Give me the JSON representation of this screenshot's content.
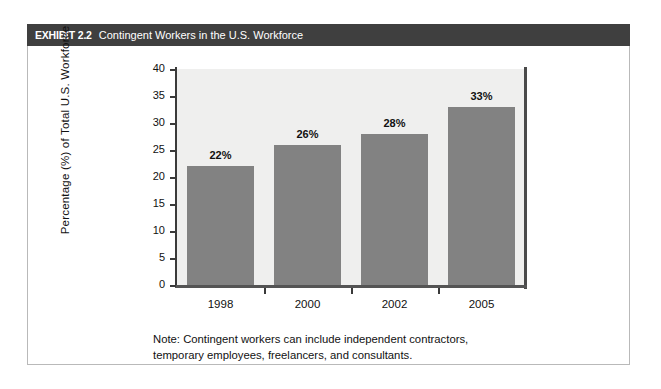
{
  "exhibit": {
    "label": "EXHIBIT 2.2",
    "title": "Contingent Workers in the U.S. Workforce",
    "header_bg": "#3f3f3f",
    "header_text_color": "#ffffff",
    "card_border_color": "#b9b9b9",
    "page_bg": "#ffffff"
  },
  "chart_data": {
    "type": "bar",
    "title": "Contingent Workers in the U.S. Workforce",
    "categories": [
      "1998",
      "2000",
      "2002",
      "2005"
    ],
    "values": [
      22,
      26,
      28,
      33
    ],
    "data_labels": [
      "22%",
      "26%",
      "28%",
      "33%"
    ],
    "xlabel": "",
    "ylabel": "Percentage (%) of Total U.S. Workforce",
    "ylim": [
      0,
      40
    ],
    "ytick_values": [
      0,
      5,
      10,
      15,
      20,
      25,
      30,
      35,
      40
    ],
    "ytick_labels": [
      "0",
      "5",
      "10",
      "15",
      "20",
      "25",
      "30",
      "35",
      "40"
    ],
    "grid": false,
    "legend": false,
    "legend_position": "none",
    "bar_color": "#828282",
    "plot_bg": "#efefee",
    "axis_color": "#3a3a3a"
  },
  "note": {
    "line1": "Note: Contingent workers can include independent contractors,",
    "line2": "temporary employees, freelancers, and consultants."
  }
}
